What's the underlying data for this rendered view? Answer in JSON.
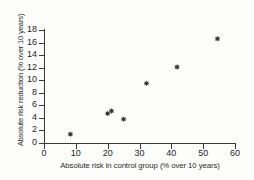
{
  "chart_data": {
    "type": "scatter",
    "title": "",
    "xlabel": "Absolute risk in control group (% over 10 years)",
    "ylabel": "Absolute risk reduction (% over 10 years)",
    "xlim": [
      0,
      60
    ],
    "ylim": [
      0,
      18
    ],
    "xticks": [
      0,
      10,
      20,
      30,
      40,
      50,
      60
    ],
    "yticks": [
      0,
      2,
      4,
      6,
      8,
      10,
      12,
      14,
      16,
      18
    ],
    "grid": false,
    "legend": null,
    "marker": "diamond-plus",
    "marker_color": "#3d3d3d",
    "background_color": "#fdfdfc",
    "axis_color": "#3a3a3a",
    "points": [
      {
        "x": 8.3,
        "y": 1.4
      },
      {
        "x": 20.0,
        "y": 4.7
      },
      {
        "x": 21.2,
        "y": 5.1
      },
      {
        "x": 25.0,
        "y": 3.8
      },
      {
        "x": 32.2,
        "y": 9.5
      },
      {
        "x": 41.8,
        "y": 12.1
      },
      {
        "x": 54.5,
        "y": 16.6
      }
    ]
  }
}
